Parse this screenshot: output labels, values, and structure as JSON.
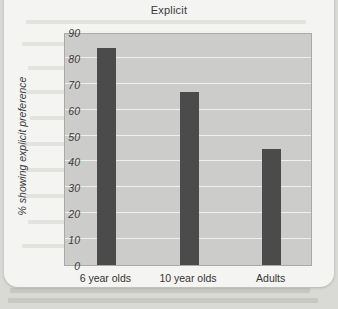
{
  "chart_data": {
    "type": "bar",
    "title": "Explicit",
    "xlabel": "",
    "ylabel": "% showing explicit preference",
    "categories": [
      "6 year olds",
      "10 year olds",
      "Adults"
    ],
    "values": [
      84,
      67,
      45
    ],
    "ylim": [
      0,
      90
    ],
    "ytick_labels": [
      "90",
      "80",
      "70",
      "60",
      "50",
      "40",
      "30",
      "20",
      "10",
      "0"
    ],
    "ytick_values": [
      90,
      80,
      70,
      60,
      50,
      40,
      30,
      20,
      10,
      0
    ],
    "grid": true,
    "legend": null,
    "bar_color": "#4b4b4b",
    "plot_background": "#cccccb",
    "gridline_color": "#efefee"
  },
  "figure": {
    "card_background": "#f4f4f2",
    "page_background": "#d9d9d6"
  }
}
